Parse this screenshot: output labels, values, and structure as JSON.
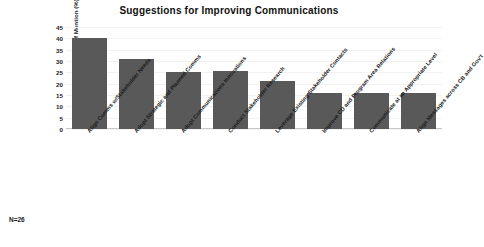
{
  "chart_data": {
    "type": "bar",
    "title": "Suggestions for Improving Communications",
    "xlabel": "",
    "ylabel": "Frequency of Mention (%)",
    "ylim": [
      0,
      45
    ],
    "ytick_step": 5,
    "yticks": [
      45,
      40,
      35,
      30,
      25,
      20,
      15,
      10,
      5,
      0
    ],
    "grid": true,
    "legend": "none",
    "bar_color": "#595959",
    "categories": [
      "Align Comms w/Stakeholder Needs",
      "Adopt Strategic and Planned Comms",
      "Adopt Communications Innovations",
      "Conduct Stakeholder Research",
      "Leverage Existing Stakeholder Contacts",
      "Improve CD and Program Area Relations",
      "Communicate at an Appropriate Level",
      "Align Messages across CB and Gov't"
    ],
    "values": [
      40,
      31,
      25,
      25.5,
      21,
      16,
      16,
      16
    ],
    "annotations": [
      "N=26"
    ]
  },
  "footnote": {
    "sample_size": "N=26"
  }
}
